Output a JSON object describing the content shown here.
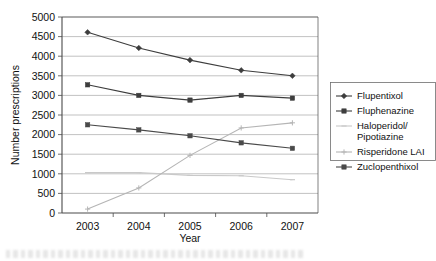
{
  "chart_data": {
    "type": "line",
    "title": "",
    "xlabel": "Year",
    "ylabel": "Number prescriptions",
    "categories": [
      "2003",
      "2004",
      "2005",
      "2006",
      "2007"
    ],
    "x": [
      2003,
      2004,
      2005,
      2006,
      2007
    ],
    "xlim": [
      2002.5,
      2007.5
    ],
    "ylim": [
      0,
      5000
    ],
    "ytick_labels": [
      "0",
      "500",
      "1000",
      "1500",
      "2000",
      "2500",
      "3000",
      "3500",
      "4000",
      "4500",
      "5000"
    ],
    "yticks": [
      0,
      500,
      1000,
      1500,
      2000,
      2500,
      3000,
      3500,
      4000,
      4500,
      5000
    ],
    "grid": true,
    "grid_axis": "y",
    "legend_position": "right",
    "series": [
      {
        "name": "Flupentixol",
        "values": [
          4610,
          4210,
          3900,
          3640,
          3500
        ],
        "color": "#3d3d3d",
        "marker": "diamond"
      },
      {
        "name": "Fluphenazine",
        "values": [
          3270,
          3000,
          2880,
          3000,
          2930
        ],
        "color": "#3d3d3d",
        "marker": "square"
      },
      {
        "name": "Haloperidol/ Pipotiazine",
        "values": [
          1030,
          1030,
          960,
          950,
          850
        ],
        "color": "#c9c9c9",
        "marker": "dash"
      },
      {
        "name": "Risperidone LAI",
        "values": [
          100,
          640,
          1470,
          2170,
          2300
        ],
        "color": "#b5b5b5",
        "marker": "cross"
      },
      {
        "name": "Zuclopenthixol",
        "values": [
          2250,
          2120,
          1970,
          1790,
          1650
        ],
        "color": "#4a4a4a",
        "marker": "square"
      }
    ]
  },
  "plot_area": {
    "left": 62,
    "top": 17,
    "right": 318,
    "bottom": 213
  },
  "caption": {
    "text": ""
  }
}
